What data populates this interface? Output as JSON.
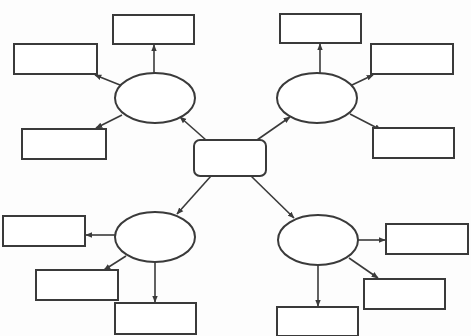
{
  "diagram": {
    "type": "graphic-organizer",
    "stroke_color": "#3a3a3a",
    "background": "#fdfdfd",
    "center": {
      "label": "",
      "shape": "rounded-rect",
      "x": 194,
      "y": 140,
      "w": 72,
      "h": 36
    },
    "branches": [
      {
        "id": "top-left",
        "ellipse": {
          "label": "",
          "cx": 155,
          "cy": 98,
          "rx": 40,
          "ry": 25
        },
        "leaves": [
          {
            "id": "tl-top",
            "label": "",
            "x": 113,
            "y": 15,
            "w": 81,
            "h": 29
          },
          {
            "id": "tl-left",
            "label": "",
            "x": 14,
            "y": 44,
            "w": 83,
            "h": 30
          },
          {
            "id": "tl-bottom",
            "label": "",
            "x": 22,
            "y": 129,
            "w": 84,
            "h": 30
          }
        ]
      },
      {
        "id": "top-right",
        "ellipse": {
          "label": "",
          "cx": 317,
          "cy": 98,
          "rx": 40,
          "ry": 25
        },
        "leaves": [
          {
            "id": "tr-top",
            "label": "",
            "x": 280,
            "y": 14,
            "w": 81,
            "h": 29
          },
          {
            "id": "tr-right",
            "label": "",
            "x": 371,
            "y": 44,
            "w": 82,
            "h": 30
          },
          {
            "id": "tr-bottom",
            "label": "",
            "x": 373,
            "y": 128,
            "w": 81,
            "h": 30
          }
        ]
      },
      {
        "id": "bottom-left",
        "ellipse": {
          "label": "",
          "cx": 155,
          "cy": 237,
          "rx": 40,
          "ry": 25
        },
        "leaves": [
          {
            "id": "bl-left",
            "label": "",
            "x": 3,
            "y": 216,
            "w": 82,
            "h": 30
          },
          {
            "id": "bl-mid",
            "label": "",
            "x": 36,
            "y": 270,
            "w": 82,
            "h": 30
          },
          {
            "id": "bl-bottom",
            "label": "",
            "x": 115,
            "y": 303,
            "w": 81,
            "h": 31
          }
        ]
      },
      {
        "id": "bottom-right",
        "ellipse": {
          "label": "",
          "cx": 318,
          "cy": 240,
          "rx": 40,
          "ry": 25
        },
        "leaves": [
          {
            "id": "br-right",
            "label": "",
            "x": 386,
            "y": 224,
            "w": 82,
            "h": 30
          },
          {
            "id": "br-mid",
            "label": "",
            "x": 364,
            "y": 279,
            "w": 81,
            "h": 30
          },
          {
            "id": "br-bottom",
            "label": "",
            "x": 277,
            "y": 307,
            "w": 81,
            "h": 29
          }
        ]
      }
    ],
    "edges": [
      {
        "from": "center",
        "to": "top-left",
        "x1": 206,
        "y1": 140,
        "x2": 180,
        "y2": 117
      },
      {
        "from": "center",
        "to": "top-right",
        "x1": 257,
        "y1": 140,
        "x2": 290,
        "y2": 117
      },
      {
        "from": "center",
        "to": "bottom-left",
        "x1": 211,
        "y1": 176,
        "x2": 177,
        "y2": 214
      },
      {
        "from": "center",
        "to": "bottom-right",
        "x1": 251,
        "y1": 176,
        "x2": 294,
        "y2": 218
      },
      {
        "from": "top-left",
        "to": "tl-top",
        "x1": 154,
        "y1": 73,
        "x2": 154,
        "y2": 45
      },
      {
        "from": "top-left",
        "to": "tl-left",
        "x1": 120,
        "y1": 85,
        "x2": 95,
        "y2": 75
      },
      {
        "from": "top-left",
        "to": "tl-bottom",
        "x1": 122,
        "y1": 115,
        "x2": 96,
        "y2": 128
      },
      {
        "from": "top-right",
        "to": "tr-top",
        "x1": 320,
        "y1": 73,
        "x2": 320,
        "y2": 44
      },
      {
        "from": "top-right",
        "to": "tr-right",
        "x1": 352,
        "y1": 85,
        "x2": 373,
        "y2": 75
      },
      {
        "from": "top-right",
        "to": "tr-bottom",
        "x1": 350,
        "y1": 114,
        "x2": 381,
        "y2": 130
      },
      {
        "from": "bottom-left",
        "to": "bl-left",
        "x1": 115,
        "y1": 235,
        "x2": 86,
        "y2": 235
      },
      {
        "from": "bottom-left",
        "to": "bl-mid",
        "x1": 126,
        "y1": 256,
        "x2": 104,
        "y2": 270
      },
      {
        "from": "bottom-left",
        "to": "bl-bottom",
        "x1": 155,
        "y1": 262,
        "x2": 155,
        "y2": 302
      },
      {
        "from": "bottom-right",
        "to": "br-right",
        "x1": 358,
        "y1": 240,
        "x2": 385,
        "y2": 240
      },
      {
        "from": "bottom-right",
        "to": "br-mid",
        "x1": 349,
        "y1": 258,
        "x2": 378,
        "y2": 278
      },
      {
        "from": "bottom-right",
        "to": "br-bottom",
        "x1": 318,
        "y1": 265,
        "x2": 318,
        "y2": 306
      }
    ]
  }
}
